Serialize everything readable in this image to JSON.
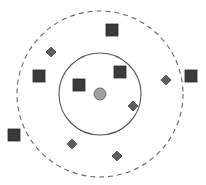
{
  "diagram": {
    "type": "knn-classification",
    "width": 206,
    "height": 185,
    "colors": {
      "background": "#ffffff",
      "square_fill": "#3a3a3a",
      "square_stroke": "#2a2a2a",
      "diamond_fill": "#5e5e5e",
      "diamond_stroke": "#444444",
      "query_fill": "#a0a0a0",
      "query_stroke": "#6a6a6a",
      "inner_circle": "#555555",
      "outer_circle": "#666666"
    },
    "query_point": {
      "cx": 100,
      "cy": 94,
      "r": 6
    },
    "inner_circle": {
      "cx": 100,
      "cy": 94,
      "r": 41,
      "style": "solid"
    },
    "outer_circle": {
      "cx": 100,
      "cy": 94,
      "r": 83,
      "style": "dashed"
    },
    "squares": [
      {
        "cx": 112,
        "cy": 30,
        "size": 12
      },
      {
        "cx": 39,
        "cy": 76,
        "size": 12
      },
      {
        "cx": 79,
        "cy": 85,
        "size": 12
      },
      {
        "cx": 120,
        "cy": 72,
        "size": 12
      },
      {
        "cx": 191,
        "cy": 76,
        "size": 12
      },
      {
        "cx": 14,
        "cy": 135,
        "size": 12
      }
    ],
    "diamonds": [
      {
        "cx": 51,
        "cy": 52,
        "size": 8
      },
      {
        "cx": 166,
        "cy": 80,
        "size": 8
      },
      {
        "cx": 133,
        "cy": 106,
        "size": 8
      },
      {
        "cx": 72,
        "cy": 144,
        "size": 8
      },
      {
        "cx": 117,
        "cy": 156,
        "size": 8
      }
    ]
  }
}
